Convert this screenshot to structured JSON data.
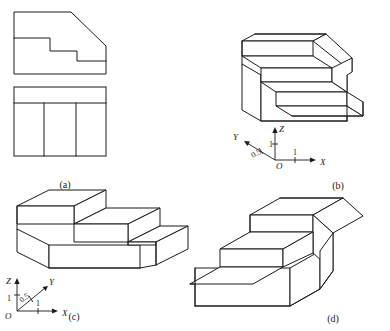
{
  "figure": {
    "stroke_color": "#1a1a1a",
    "background_color": "#ffffff"
  },
  "panels": [
    {
      "id": "a",
      "caption": "(a)",
      "kind": "orthographic-views",
      "views": [
        {
          "name": "front-view",
          "description": "stepped profile with chamfer at upper right"
        },
        {
          "name": "top-view",
          "description": "rectangle with rear band and two vertical dividers"
        }
      ]
    },
    {
      "id": "b",
      "caption": "(b)",
      "kind": "axonometric-pictorial",
      "axes": {
        "x": {
          "label": "X",
          "value": "1"
        },
        "y": {
          "label": "Y",
          "value": "0.5"
        },
        "z": {
          "label": "Z",
          "value": "1"
        },
        "origin": {
          "label": "O"
        }
      }
    },
    {
      "id": "c",
      "caption": "(c)",
      "kind": "axonometric-pictorial",
      "axes": {
        "x": {
          "label": "X",
          "value": "1"
        },
        "y": {
          "label": "Y",
          "value": "0.5"
        },
        "z": {
          "label": "Z",
          "value": "1"
        },
        "origin": {
          "label": "O"
        }
      }
    },
    {
      "id": "d",
      "caption": "(d)",
      "kind": "axonometric-pictorial",
      "axes": null
    }
  ]
}
